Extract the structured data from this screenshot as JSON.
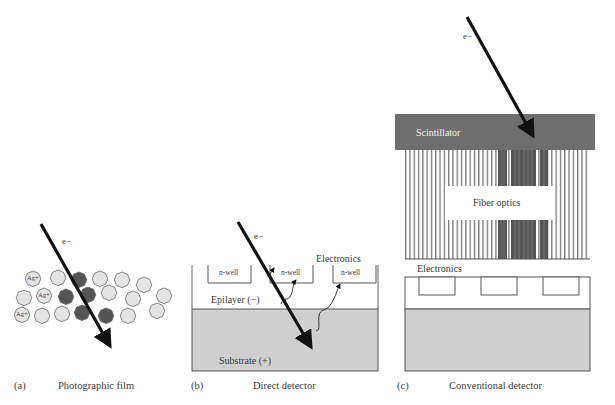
{
  "figure": {
    "panels": [
      {
        "id": "a",
        "letter": "(a)",
        "caption": "Photographic film",
        "electron_label": "e−",
        "grain_label": "Ag+",
        "grains": {
          "unexposed_color": "#e4e4e4",
          "exposed_color": "#555555"
        }
      },
      {
        "id": "b",
        "letter": "(b)",
        "caption": "Direct detector",
        "electron_label": "e−",
        "electronics_label": "Electronics",
        "nwell_label": "n-well",
        "epilayer_label": "Epilayer (−)",
        "substrate_label": "Substrate (+)",
        "substrate_color": "#cfcfcf"
      },
      {
        "id": "c",
        "letter": "(c)",
        "caption": "Conventional detector",
        "electron_label": "e−",
        "scintillator_label": "Scintillator",
        "fiber_label": "Fiber optics",
        "electronics_label": "Electronics",
        "scintillator_color": "#6e6e6e",
        "fiber_dark_color": "#555555",
        "substrate_color": "#cfcfcf"
      }
    ]
  }
}
